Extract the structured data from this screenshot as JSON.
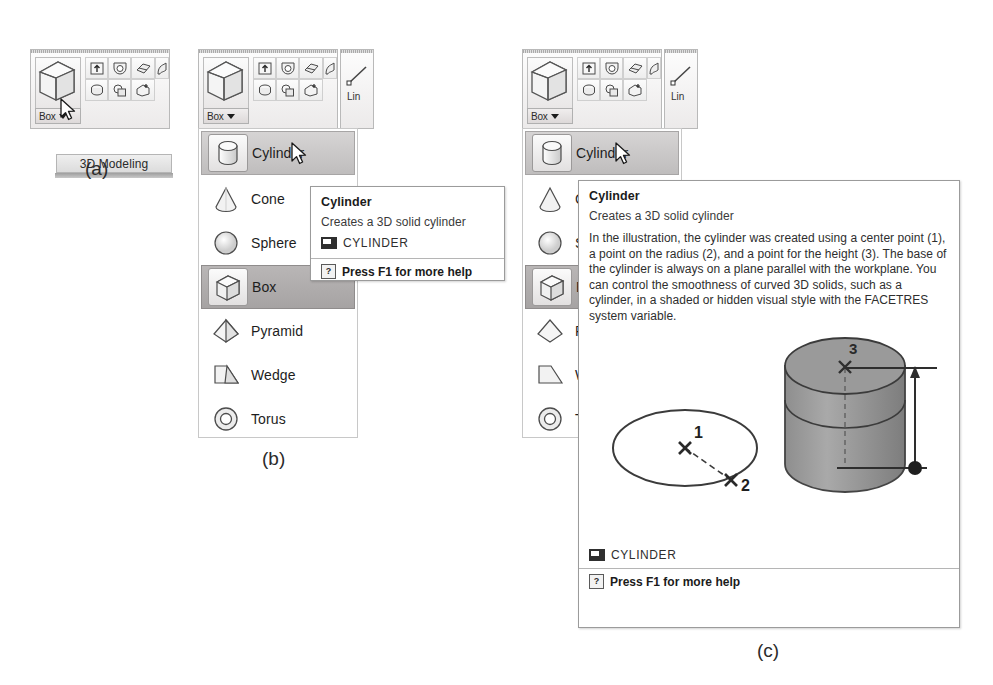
{
  "figure": {
    "captions": {
      "a": "(a)",
      "b": "(b)",
      "c": "(c)"
    }
  },
  "ribbon": {
    "box_button_label": "Box",
    "dropdown_arrow": "dropdown-caret",
    "panel_title": "3D Modeling",
    "adjacent_panel_label": "Lin",
    "big_icon": "box-solid-icon",
    "small_icons": [
      "extrude-icon",
      "revolve-icon",
      "loft-icon",
      "sweep-icon",
      "presspull-icon",
      "union-icon",
      "slice-icon"
    ]
  },
  "menu": {
    "items": [
      {
        "label": "Cylinder",
        "icon": "cylinder-icon",
        "state": "hover"
      },
      {
        "label": "Cone",
        "icon": "cone-icon",
        "state": "normal"
      },
      {
        "label": "Sphere",
        "icon": "sphere-icon",
        "state": "normal"
      },
      {
        "label": "Box",
        "icon": "box-icon",
        "state": "selected"
      },
      {
        "label": "Pyramid",
        "icon": "pyramid-icon",
        "state": "normal"
      },
      {
        "label": "Wedge",
        "icon": "wedge-icon",
        "state": "normal"
      },
      {
        "label": "Torus",
        "icon": "torus-icon",
        "state": "normal"
      }
    ]
  },
  "tooltip_small": {
    "title": "Cylinder",
    "subtitle": "Creates a 3D solid cylinder",
    "command_icon": "command-monitor-icon",
    "command": "CYLINDER",
    "help_icon": "question-mark-icon",
    "help_text": "Press F1 for more help"
  },
  "tooltip_large": {
    "title": "Cylinder",
    "subtitle": "Creates a 3D solid cylinder",
    "paragraph": "In the illustration, the cylinder was created using a center point (1), a point on the radius (2), and a point for the height (3). The base of the cylinder is always on a plane parallel with the workplane. You can control the smoothness of curved 3D solids, such as a cylinder, in a shaded or hidden visual style with the FACETRES system variable.",
    "command_icon": "command-monitor-icon",
    "command": "CYLINDER",
    "help_icon": "question-mark-icon",
    "help_text": "Press F1 for more help",
    "illustration": {
      "name": "cylinder-construction-illustration",
      "point_labels": [
        "1",
        "2",
        "3"
      ],
      "shapes": [
        "base-ellipse",
        "radius-vector",
        "shaded-cylinder",
        "height-dimension-arrow"
      ]
    }
  }
}
